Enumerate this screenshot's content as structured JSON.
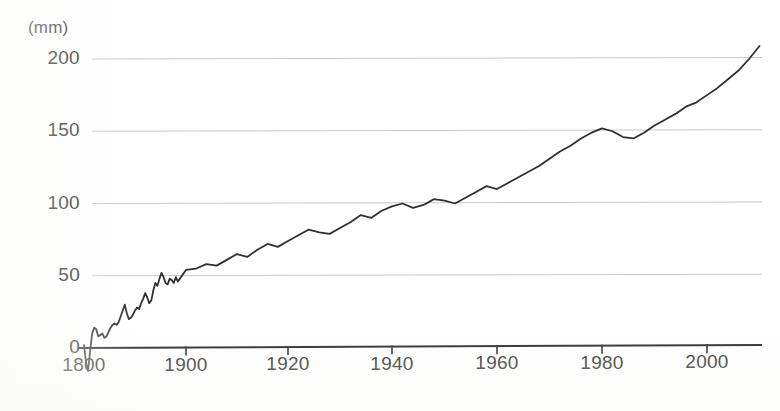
{
  "axis_unit_label": "(mm)",
  "y_ticks": [
    {
      "value": 0,
      "label": "0"
    },
    {
      "value": 50,
      "label": "50"
    },
    {
      "value": 100,
      "label": "100"
    },
    {
      "value": 150,
      "label": "150"
    },
    {
      "value": 200,
      "label": "200"
    }
  ],
  "x_ticks": [
    {
      "label": "1800",
      "px": 84
    },
    {
      "label": "1900",
      "px": 186
    },
    {
      "label": "1920",
      "px": 288
    },
    {
      "label": "1940",
      "px": 392
    },
    {
      "label": "1960",
      "px": 497
    },
    {
      "label": "1980",
      "px": 602
    },
    {
      "label": "2000",
      "px": 707
    }
  ],
  "colors": {
    "line": "#303030",
    "axis": "#1f1f1f",
    "gridline": "#c9c9c9",
    "tick_text": "#262626",
    "background": "#ffffff"
  },
  "chart_data": {
    "type": "line",
    "title": "",
    "subtitle": "",
    "xlabel": "",
    "ylabel": "(mm)",
    "ylim": [
      -18,
      215
    ],
    "xlim": [
      1800,
      2010
    ],
    "grid": true,
    "grid_axis": "y",
    "legend": false,
    "legend_position": "none",
    "y_tick_values": [
      0,
      50,
      100,
      150,
      200
    ],
    "x_tick_values": [
      1800,
      1900,
      1920,
      1940,
      1960,
      1980,
      2000
    ],
    "annotations": [],
    "note_axis_spacing": "1800-to-1900 segment drawn same pixel width as each 20-year segment (compressed leading segment as in source scan)",
    "series": [
      {
        "name": "cumulative rise",
        "x": [
          1800,
          1802,
          1804,
          1806,
          1808,
          1810,
          1812,
          1814,
          1816,
          1818,
          1820,
          1822,
          1824,
          1826,
          1828,
          1830,
          1832,
          1834,
          1836,
          1838,
          1840,
          1842,
          1844,
          1846,
          1848,
          1850,
          1852,
          1854,
          1856,
          1858,
          1860,
          1862,
          1864,
          1866,
          1868,
          1870,
          1872,
          1874,
          1876,
          1878,
          1880,
          1882,
          1884,
          1886,
          1888,
          1890,
          1892,
          1894,
          1896,
          1898,
          1900,
          1902,
          1904,
          1906,
          1908,
          1910,
          1912,
          1914,
          1916,
          1918,
          1920,
          1922,
          1924,
          1926,
          1928,
          1930,
          1932,
          1934,
          1936,
          1938,
          1940,
          1942,
          1944,
          1946,
          1948,
          1950,
          1952,
          1954,
          1956,
          1958,
          1960,
          1962,
          1964,
          1966,
          1968,
          1970,
          1972,
          1974,
          1976,
          1978,
          1980,
          1982,
          1984,
          1986,
          1988,
          1990,
          1992,
          1994,
          1996,
          1998,
          2000,
          2002,
          2004,
          2006,
          2008,
          2010
        ],
        "y": [
          2,
          -10,
          -16,
          -2,
          10,
          14,
          13,
          8,
          9,
          10,
          7,
          8,
          11,
          14,
          16,
          17,
          16,
          18,
          22,
          26,
          30,
          24,
          20,
          21,
          23,
          26,
          28,
          27,
          31,
          34,
          38,
          35,
          31,
          33,
          40,
          45,
          43,
          48,
          52,
          49,
          45,
          44,
          48,
          47,
          45,
          49,
          46,
          48,
          50,
          52,
          54,
          55,
          58,
          57,
          61,
          65,
          63,
          68,
          72,
          70,
          74,
          78,
          82,
          80,
          79,
          83,
          87,
          92,
          90,
          95,
          98,
          100,
          97,
          99,
          103,
          102,
          100,
          104,
          108,
          112,
          110,
          114,
          118,
          122,
          126,
          131,
          136,
          140,
          145,
          149,
          152,
          150,
          146,
          145,
          149,
          154,
          158,
          162,
          167,
          170,
          175,
          180,
          186,
          192,
          200,
          209
        ],
        "units": "mm"
      }
    ]
  }
}
